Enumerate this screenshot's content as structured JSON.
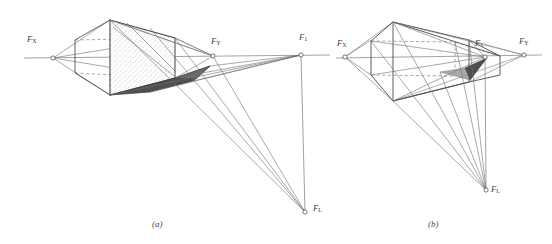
{
  "figure": {
    "background_color": "#ffffff",
    "ink_color": "#4a4a4a",
    "shadow_fill_color": "#4f4f4f",
    "stipple_color": "#8a8a8a",
    "width": 552,
    "height": 244
  },
  "panels": [
    {
      "id": "a",
      "caption": "(a)",
      "caption_x": 152,
      "caption_y": 219,
      "object_style": "stippled-solid-cube",
      "labels": [
        {
          "name": "fx",
          "base": "F",
          "sub": "X",
          "x": 27,
          "y": 40
        },
        {
          "name": "fy",
          "base": "F",
          "sub": "Y",
          "x": 211,
          "y": 42
        },
        {
          "name": "f1",
          "base": "F",
          "sub": "1",
          "x": 299,
          "y": 38
        },
        {
          "name": "fl",
          "base": "F",
          "sub": "L",
          "x": 313,
          "y": 203
        }
      ],
      "points": {
        "fx": [
          53,
          58
        ],
        "fy": [
          213,
          56
        ],
        "f1": [
          301,
          55
        ],
        "fl": [
          305,
          212
        ]
      },
      "horizon": {
        "x1": 24,
        "y1": 58,
        "x2": 330,
        "y2": 55
      }
    },
    {
      "id": "b",
      "caption": "(b)",
      "caption_x": 428,
      "caption_y": 219,
      "object_style": "wireframe-cube",
      "labels": [
        {
          "name": "fx",
          "base": "F",
          "sub": "X",
          "x": 337,
          "y": 44
        },
        {
          "name": "f1",
          "base": "F",
          "sub": "1",
          "x": 475,
          "y": 44
        },
        {
          "name": "fy",
          "base": "F",
          "sub": "Y",
          "x": 522,
          "y": 42
        },
        {
          "name": "fl",
          "base": "F",
          "sub": "L",
          "x": 492,
          "y": 190
        }
      ],
      "points": {
        "fx": [
          345,
          57
        ],
        "f1": [
          485,
          57
        ],
        "fy": [
          524,
          55
        ],
        "fl": [
          486,
          190
        ]
      },
      "horizon": {
        "x1": 336,
        "y1": 58,
        "x2": 542,
        "y2": 55
      }
    }
  ],
  "annotations": {
    "vanishing_point_x_name": "F_X",
    "vanishing_point_y_name": "F_Y",
    "light_source_name": "F_1",
    "light_ground_point_name": "F_L"
  }
}
